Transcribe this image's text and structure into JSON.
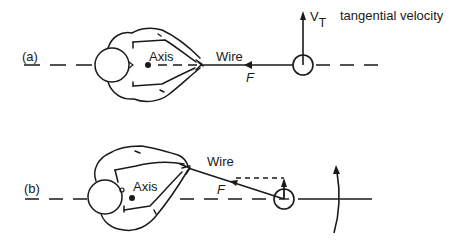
{
  "diagram": {
    "panel_a": {
      "label": "(a)",
      "axis_label": "Axis",
      "wire_label": "Wire",
      "force_label": "F",
      "velocity_symbol": "V",
      "velocity_subscript": "T",
      "velocity_caption": "tangential velocity"
    },
    "panel_b": {
      "label": "(b)",
      "axis_label": "Axis",
      "wire_label": "Wire",
      "force_label": "F"
    },
    "colors": {
      "ink": "#1a1a1a",
      "background": "#ffffff"
    }
  }
}
